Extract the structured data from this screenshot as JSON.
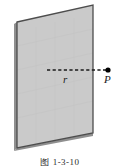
{
  "figure": {
    "caption": "图 1-3-10",
    "surface": {
      "name": "charged-plane",
      "fill_color": "#cacaca",
      "edge_color": "#4d4d4d",
      "shadow_color": "#8a8a8a",
      "points": "17,22 93,5 93,133 17,148"
    },
    "distance_line": {
      "label": "r",
      "style": "dashed",
      "color": "#1a1a1a",
      "x_start": 47,
      "x_end": 108,
      "y": 70
    },
    "field_point": {
      "label": "P",
      "marker": "filled-dot",
      "color": "#000000",
      "x": 108,
      "y": 70,
      "radius": 2.6
    }
  }
}
